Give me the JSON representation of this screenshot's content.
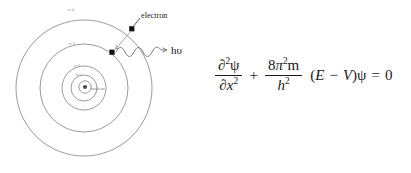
{
  "figure": {
    "background_color": "#ffffff",
    "line_color": "#8e8e8e",
    "text_color": "#1a1a1a"
  },
  "atom_diagram": {
    "shell_labels": [
      {
        "id": "n4",
        "text": "n=4"
      },
      {
        "id": "n3",
        "text": "n=3"
      },
      {
        "id": "n2",
        "text": "n=2"
      },
      {
        "id": "n1",
        "text": "n=1"
      }
    ],
    "nucleus_label": "nucleus",
    "electron_label": "electron",
    "photon_label": "hυ",
    "caption": ""
  },
  "equation": {
    "partial": "∂",
    "psi": "ψ",
    "pi": "π",
    "first_fraction": {
      "numerator_partial": "∂",
      "numerator_exponent": "2",
      "numerator_psi": "ψ",
      "denominator_partial": "∂",
      "denominator_var": "x",
      "denominator_exponent": "2"
    },
    "plus_operator": "+",
    "second_fraction": {
      "numerator_coefficient": "8",
      "numerator_pi": "π",
      "numerator_pi_exponent": "2",
      "numerator_mass": "m",
      "denominator_planck": "h",
      "denominator_exponent": "2"
    },
    "open_paren": "(",
    "energy": "E",
    "minus_operator": "−",
    "potential": "V",
    "close_paren": ")",
    "trailing_psi": "ψ",
    "equals": "=",
    "right_hand_side": "0",
    "plain_text": "∂2ψ/∂x² + 8π²m/h² (E − V)ψ = 0"
  }
}
